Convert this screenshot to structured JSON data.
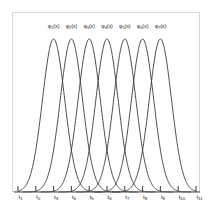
{
  "figure": {
    "background_color": "#ffffff",
    "frame_color": "#d8d8d8",
    "curve_color": "#3a3a3a",
    "axis_color": "#4a4a4a"
  },
  "chart_data": {
    "type": "line",
    "title": "",
    "subtitle": "",
    "xlabel": "",
    "ylabel": "",
    "grid": false,
    "legend_position": "inside-top",
    "xlim": [
      1,
      11
    ],
    "ylim": [
      0,
      1.12
    ],
    "x_tick_labels": [
      "t1",
      "t2",
      "t3",
      "t4",
      "t5",
      "t6",
      "t7",
      "t8",
      "t9",
      "t10",
      "t11"
    ],
    "x_tick_values": [
      1,
      2,
      3,
      4,
      5,
      6,
      7,
      8,
      9,
      10,
      11
    ],
    "x_tick_label_bases": [
      "t",
      "t",
      "t",
      "t",
      "t",
      "t",
      "t",
      "t",
      "t",
      "t",
      "t"
    ],
    "x_tick_label_subs": [
      "1",
      "2",
      "3",
      "4",
      "5",
      "6",
      "7",
      "8",
      "9",
      "10",
      "11"
    ],
    "y_tick_labels": [],
    "annotations": [],
    "series": [
      {
        "name": "phi1",
        "label_base": "φ",
        "label_sub": "1",
        "label_suffix": "(x)",
        "peak_x": 3,
        "peak_y": 1.0,
        "width": 0.88
      },
      {
        "name": "phi2",
        "label_base": "φ",
        "label_sub": "2",
        "label_suffix": "(x)",
        "peak_x": 4,
        "peak_y": 1.0,
        "width": 0.88
      },
      {
        "name": "phi3",
        "label_base": "φ",
        "label_sub": "3",
        "label_suffix": "(x)",
        "peak_x": 5,
        "peak_y": 1.0,
        "width": 0.88
      },
      {
        "name": "phi4",
        "label_base": "φ",
        "label_sub": "4",
        "label_suffix": "(x)",
        "peak_x": 6,
        "peak_y": 1.0,
        "width": 0.88
      },
      {
        "name": "phi5",
        "label_base": "φ",
        "label_sub": "5",
        "label_suffix": "(x)",
        "peak_x": 7,
        "peak_y": 1.0,
        "width": 0.88
      },
      {
        "name": "phi6",
        "label_base": "φ",
        "label_sub": "6",
        "label_suffix": "(x)",
        "peak_x": 8,
        "peak_y": 1.0,
        "width": 0.88
      },
      {
        "name": "phi7",
        "label_base": "φ",
        "label_sub": "7",
        "label_suffix": "(x)",
        "peak_x": 9,
        "peak_y": 1.0,
        "width": 0.88
      }
    ]
  }
}
